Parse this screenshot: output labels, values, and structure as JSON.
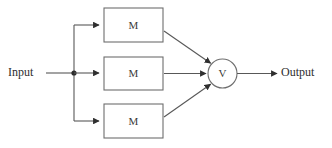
{
  "diagram": {
    "input_label": "Input",
    "output_label": "Output",
    "combiner_label": "V",
    "blocks": [
      {
        "label": "M",
        "x": 104,
        "y": 8,
        "w": 59,
        "h": 34
      },
      {
        "label": "M",
        "x": 104,
        "y": 57,
        "w": 59,
        "h": 33
      },
      {
        "label": "M",
        "x": 104,
        "y": 104,
        "w": 59,
        "h": 34
      }
    ],
    "combiner": {
      "cx": 222.5,
      "cy": 73.5,
      "r": 14.5
    },
    "junction": {
      "x": 74,
      "y": 73,
      "r": 2.6
    },
    "colors": {
      "background": "#ffffff",
      "box_stroke": "#6e6e6e",
      "wire": "#585858",
      "text": "#2e2e2e",
      "label_text": "#3a3a3a",
      "dot": "#2b2b2b"
    },
    "geometry": {
      "input_line_start_x": 46,
      "input_line_y": 73,
      "bus_x": 74,
      "bus_top_y": 25,
      "bus_bottom_y": 121,
      "box_left_x": 104,
      "box_right_x": 163,
      "top_branch_y": 25,
      "mid_branch_y": 73,
      "bottom_branch_y": 121,
      "output_line_end_x": 277,
      "output_text_x": 281,
      "input_text_x": 8
    }
  }
}
